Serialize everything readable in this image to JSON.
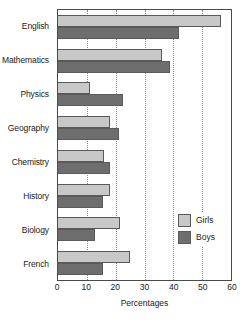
{
  "chart_data": {
    "type": "bar",
    "orientation": "horizontal",
    "title": "",
    "xlabel": "Percentages",
    "ylabel": "",
    "xlim": [
      0,
      60
    ],
    "xticks": [
      0,
      10,
      20,
      30,
      40,
      50,
      60
    ],
    "grid": true,
    "legend_position": "inside-right-lower",
    "categories": [
      "English",
      "Mathematics",
      "Physics",
      "Geography",
      "Chemistry",
      "History",
      "Biology",
      "French"
    ],
    "series": [
      {
        "name": "Girls",
        "color": "#c8c8c8",
        "values": [
          56.5,
          36,
          11,
          18,
          16,
          18,
          21.5,
          25
        ]
      },
      {
        "name": "Boys",
        "color": "#6e6e6e",
        "values": [
          42,
          39,
          22.5,
          21,
          18,
          15.5,
          13,
          15.5
        ]
      }
    ]
  },
  "legend": {
    "entries": [
      {
        "label": "Girls"
      },
      {
        "label": "Boys"
      }
    ]
  },
  "colors": {
    "girls": "#c8c8c8",
    "boys": "#6e6e6e",
    "axis": "#4a4a4a",
    "grid": "#8a8a8a",
    "background": "#ffffff"
  }
}
